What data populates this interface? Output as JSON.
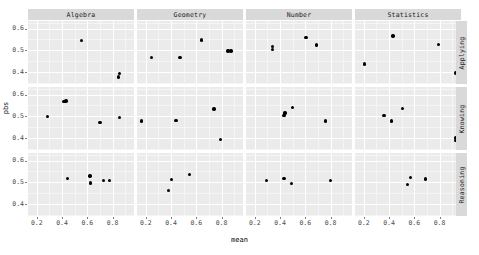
{
  "chart_data": {
    "type": "scatter",
    "title": "",
    "xlabel": "mean",
    "ylabel": "pbs",
    "xlim": [
      0.13,
      0.97
    ],
    "ylim": [
      0.345,
      0.635
    ],
    "xticks": [
      0.2,
      0.4,
      0.6,
      0.8
    ],
    "xticklabels": [
      "0.2",
      "0.4",
      "0.6",
      "0.8"
    ],
    "yticks": [
      0.4,
      0.5,
      0.6
    ],
    "yticklabels": [
      "0.4",
      "0.5",
      "0.6"
    ],
    "grid": true,
    "legend": "none",
    "facet_cols": [
      "Algebra",
      "Geometry",
      "Number",
      "Statistics"
    ],
    "facet_rows": [
      "Applying",
      "Knowing",
      "Reasoning"
    ],
    "panels": [
      {
        "col": "Algebra",
        "row": "Applying",
        "points": [
          {
            "mean": 0.555,
            "pbs": 0.545
          },
          {
            "mean": 0.855,
            "pbs": 0.392
          },
          {
            "mean": 0.845,
            "pbs": 0.378
          }
        ]
      },
      {
        "col": "Geometry",
        "row": "Applying",
        "points": [
          {
            "mean": 0.64,
            "pbs": 0.548
          },
          {
            "mean": 0.85,
            "pbs": 0.497
          },
          {
            "mean": 0.875,
            "pbs": 0.497
          },
          {
            "mean": 0.245,
            "pbs": 0.468
          },
          {
            "mean": 0.47,
            "pbs": 0.466
          }
        ]
      },
      {
        "col": "Number",
        "row": "Applying",
        "points": [
          {
            "mean": 0.605,
            "pbs": 0.559
          },
          {
            "mean": 0.69,
            "pbs": 0.525
          },
          {
            "mean": 0.34,
            "pbs": 0.519
          },
          {
            "mean": 0.338,
            "pbs": 0.503
          }
        ]
      },
      {
        "col": "Statistics",
        "row": "Applying",
        "points": [
          {
            "mean": 0.43,
            "pbs": 0.566
          },
          {
            "mean": 0.79,
            "pbs": 0.528
          },
          {
            "mean": 0.205,
            "pbs": 0.437
          },
          {
            "mean": 0.93,
            "pbs": 0.395
          }
        ]
      },
      {
        "col": "Algebra",
        "row": "Knowing",
        "points": [
          {
            "mean": 0.415,
            "pbs": 0.568
          },
          {
            "mean": 0.43,
            "pbs": 0.57
          },
          {
            "mean": 0.285,
            "pbs": 0.499
          },
          {
            "mean": 0.7,
            "pbs": 0.473
          },
          {
            "mean": 0.855,
            "pbs": 0.496
          }
        ]
      },
      {
        "col": "Geometry",
        "row": "Knowing",
        "points": [
          {
            "mean": 0.74,
            "pbs": 0.533
          },
          {
            "mean": 0.165,
            "pbs": 0.478
          },
          {
            "mean": 0.44,
            "pbs": 0.481
          },
          {
            "mean": 0.79,
            "pbs": 0.392
          }
        ]
      },
      {
        "col": "Number",
        "row": "Knowing",
        "points": [
          {
            "mean": 0.5,
            "pbs": 0.54
          },
          {
            "mean": 0.44,
            "pbs": 0.515
          },
          {
            "mean": 0.432,
            "pbs": 0.505
          },
          {
            "mean": 0.76,
            "pbs": 0.478
          }
        ]
      },
      {
        "col": "Statistics",
        "row": "Knowing",
        "points": [
          {
            "mean": 0.505,
            "pbs": 0.535
          },
          {
            "mean": 0.36,
            "pbs": 0.503
          },
          {
            "mean": 0.42,
            "pbs": 0.478
          },
          {
            "mean": 0.93,
            "pbs": 0.4
          },
          {
            "mean": 0.93,
            "pbs": 0.39
          }
        ]
      },
      {
        "col": "Algebra",
        "row": "Reasoning",
        "points": [
          {
            "mean": 0.62,
            "pbs": 0.53
          },
          {
            "mean": 0.445,
            "pbs": 0.518
          },
          {
            "mean": 0.73,
            "pbs": 0.508
          },
          {
            "mean": 0.775,
            "pbs": 0.508
          },
          {
            "mean": 0.625,
            "pbs": 0.497
          }
        ]
      },
      {
        "col": "Geometry",
        "row": "Reasoning",
        "points": [
          {
            "mean": 0.545,
            "pbs": 0.535
          },
          {
            "mean": 0.405,
            "pbs": 0.512
          },
          {
            "mean": 0.38,
            "pbs": 0.462
          }
        ]
      },
      {
        "col": "Number",
        "row": "Reasoning",
        "points": [
          {
            "mean": 0.43,
            "pbs": 0.518
          },
          {
            "mean": 0.29,
            "pbs": 0.508
          },
          {
            "mean": 0.8,
            "pbs": 0.508
          },
          {
            "mean": 0.49,
            "pbs": 0.495
          }
        ]
      },
      {
        "col": "Statistics",
        "row": "Reasoning",
        "points": [
          {
            "mean": 0.57,
            "pbs": 0.522
          },
          {
            "mean": 0.69,
            "pbs": 0.515
          },
          {
            "mean": 0.545,
            "pbs": 0.489
          }
        ]
      }
    ]
  },
  "axis": {
    "x_title": "mean",
    "y_title": "pbs"
  },
  "caption": ""
}
